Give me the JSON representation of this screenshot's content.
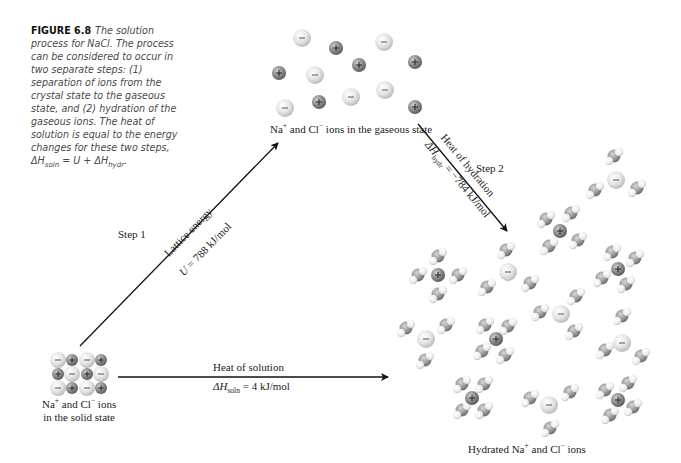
{
  "caption": {
    "figure_label": "FIGURE 6.8",
    "text": "The solution process for NaCl. The process can be considered to occur in two separate steps: (1) separation of ions from the crystal state to the gaseous state, and (2) hydration of the gaseous ions. The heat of solution is equal to the energy changes for these two steps, ",
    "equation_lhs": "ΔH",
    "equation_lhs_sub": "soln",
    "equation_mid": " = U + ΔH",
    "equation_rhs_sub": "hydr",
    "equation_end": "."
  },
  "states": {
    "gaseous": {
      "prefix": "Na",
      "na_sup": "+",
      "mid": " and Cl",
      "cl_sup": "−",
      "suffix": " ions in the gaseous state"
    },
    "solid": {
      "line1_prefix": "Na",
      "na_sup": "+",
      "line1_mid": " and Cl",
      "cl_sup": "−",
      "line1_suffix": " ions",
      "line2": "in the solid state"
    },
    "hydrated": {
      "prefix": "Hydrated Na",
      "na_sup": "+",
      "mid": " and Cl",
      "cl_sup": "−",
      "suffix": " ions"
    }
  },
  "steps": {
    "step1": {
      "label": "Step 1",
      "title": "Lattice energy",
      "value_symbol": "U",
      "value_text": " = 788 kJ/mol"
    },
    "step2": {
      "label": "Step 2",
      "title": "Heat of hydration",
      "value_symbol": "ΔH",
      "value_sub": "hydr",
      "value_text": " = −784 kJ/mol"
    },
    "solution": {
      "title": "Heat of solution",
      "value_symbol": "ΔH",
      "value_sub": "soln",
      "value_text": " = 4 kJ/mol"
    }
  },
  "ion_symbols": {
    "na": "+",
    "cl": "−"
  },
  "colors": {
    "na": "#8a8a8a",
    "cl": "#e6e6e6",
    "water_o": "#9a9a9a",
    "water_h": "#f2f2f2",
    "arrow": "#111111",
    "caption": "#4a4a4a"
  }
}
